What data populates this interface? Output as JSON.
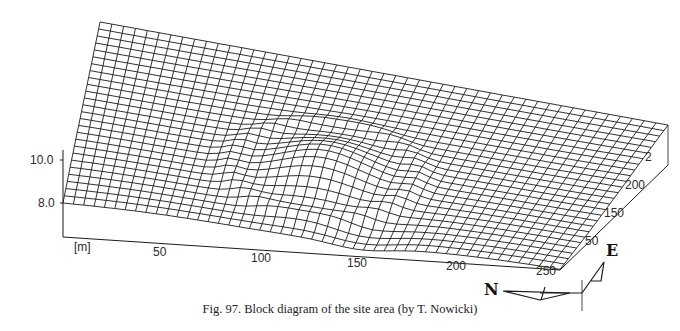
{
  "figure": {
    "caption": "Fig. 97. Block diagram of the site area (by T. Nowicki)",
    "author": "T. Nowicki",
    "figure_number": "97"
  },
  "axes": {
    "vertical": {
      "ticks": [
        {
          "label": "10.0",
          "x": 30,
          "y": 154
        },
        {
          "label": "8.0",
          "x": 38,
          "y": 197
        }
      ]
    },
    "bottom": {
      "unit_label": "[m]",
      "unit_pos": {
        "x": 74,
        "y": 241
      },
      "ticks": [
        {
          "label": "50",
          "x": 153,
          "y": 246
        },
        {
          "label": "100",
          "x": 251,
          "y": 252
        },
        {
          "label": "150",
          "x": 347,
          "y": 257
        },
        {
          "label": "200",
          "x": 446,
          "y": 260
        },
        {
          "label": "250",
          "x": 536,
          "y": 265
        }
      ]
    },
    "right": {
      "ticks": [
        {
          "label": "50",
          "x": 585,
          "y": 235
        },
        {
          "label": "150",
          "x": 604,
          "y": 207
        },
        {
          "label": "200",
          "x": 625,
          "y": 179
        },
        {
          "label": "2",
          "x": 645,
          "y": 151
        }
      ]
    }
  },
  "compass": {
    "north_label": "N",
    "east_label": "E"
  },
  "surface": {
    "rows": 26,
    "cols": 48,
    "line_color": "#1a1a1a",
    "corners": {
      "back_left": [
        100,
        22
      ],
      "back_right": [
        668,
        125
      ],
      "front_left": [
        63,
        203
      ],
      "front_right": [
        560,
        270
      ]
    },
    "mound": {
      "u": 0.47,
      "v": 0.38,
      "height": 22,
      "ru": 0.14,
      "rv": 0.22
    },
    "base_drop": 34
  }
}
